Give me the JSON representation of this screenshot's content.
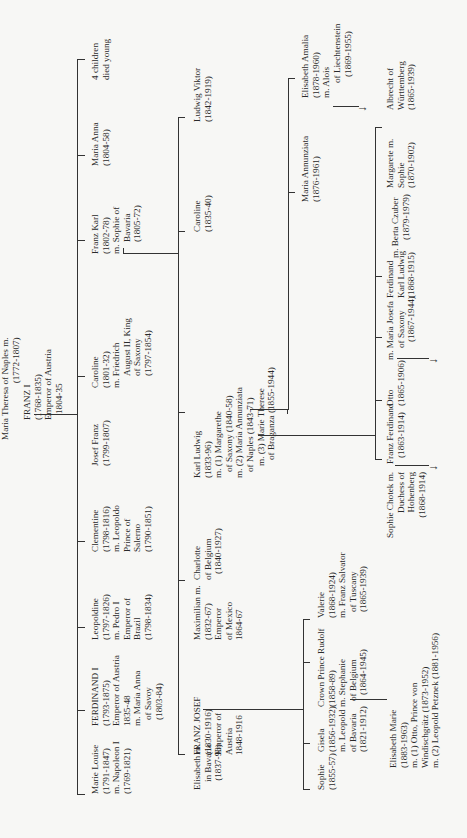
{
  "root": {
    "wife": [
      "Maria Theresa of Naples m.",
      "(1772-1807)"
    ],
    "husband": [
      "FRANZ I",
      "(1768-1835)",
      "Emperor of Austria",
      "1804-35"
    ]
  },
  "gen1": [
    {
      "id": "marie-louise",
      "lines": [
        "Marie Louise",
        "(1791-1847)",
        "m. Napoleon I",
        "(1769-1821)"
      ]
    },
    {
      "id": "ferdinand-i",
      "lines": [
        "FERDINAND I",
        "(1793-1875)",
        "Emperor of Austria",
        "1835-48",
        "m. Maria Anna",
        "of Savoy",
        "(1803-84)"
      ]
    },
    {
      "id": "leopoldine",
      "lines": [
        "Leopoldine",
        "(1797-1826)",
        "m. Pedro I",
        "Emperor of",
        "Brazil",
        "(1798-1834)"
      ]
    },
    {
      "id": "clementine",
      "lines": [
        "Clementine",
        "(1798-1816)",
        "m. Leopoldo",
        "Prince of",
        "Salerno",
        "(1790-1851)"
      ]
    },
    {
      "id": "josef-franz",
      "lines": [
        "Josef Franz",
        "(1799-1807)"
      ]
    },
    {
      "id": "caroline-1801",
      "lines": [
        "Caroline",
        "(1801-32)",
        "m. Friedrich",
        "August II, King",
        "of Saxony",
        "(1797-1854)"
      ]
    },
    {
      "id": "franz-karl",
      "lines": [
        "Franz Karl",
        "(1802-78)",
        "m. Sophie of",
        "Bavaria",
        "(1805-72)"
      ]
    },
    {
      "id": "maria-anna",
      "lines": [
        "Maria Anna",
        "(1804-58)"
      ]
    },
    {
      "id": "four-children",
      "lines": [
        "4 children",
        "died young"
      ]
    }
  ],
  "gen2": [
    {
      "id": "elisabeth-bavaria",
      "lines": [
        "Elisabeth m.",
        "in Bavaria",
        "(1837-98)"
      ]
    },
    {
      "id": "franz-josef",
      "lines": [
        "FRANZ JOSEF",
        "(1830-1916)",
        "Emperor of",
        "Austria",
        "1848-1916"
      ]
    },
    {
      "id": "maximilian",
      "lines": [
        "Maximilian m.",
        "(1832-67)",
        "Emperor",
        "of Mexico",
        "1864-67"
      ]
    },
    {
      "id": "charlotte",
      "lines": [
        "Charlotte",
        "of Belgium",
        "(1840-1927)"
      ]
    },
    {
      "id": "karl-ludwig",
      "lines": [
        "Karl Ludwig",
        "(1833-96)",
        "m. (1) Margarethe",
        "of Saxony (1840-58)",
        "m. (2) Maria Annunziata",
        "of Naples (1843-71)",
        "m. (3) Marie Therese",
        "of Braganza (1855-1944)"
      ]
    },
    {
      "id": "caroline-1835",
      "lines": [
        "Caroline",
        "(1835-40)"
      ]
    },
    {
      "id": "ludwig-viktor",
      "lines": [
        "Ludwig Viktor",
        "(1842-1919)"
      ]
    }
  ],
  "gen3_franz_josef": [
    {
      "id": "sophie",
      "lines": [
        "Sophie",
        "(1855-57)"
      ]
    },
    {
      "id": "gisela",
      "lines": [
        "Gisela",
        "(1856-1932)",
        "m. Leopold",
        "of Bavaria",
        "(1821-1912)"
      ]
    },
    {
      "id": "rudolf",
      "lines": [
        "Crown Prince Rudolf",
        "(1858-89)",
        "m. Stephanie",
        "of Belgium",
        "(1864-1945)"
      ]
    },
    {
      "id": "valerie",
      "lines": [
        "Valerie",
        "(1868-1924)",
        "m. Franz Salvator",
        "of Tuscany",
        "(1865-1939)"
      ]
    }
  ],
  "gen4_rudolf": {
    "id": "elisabeth-marie",
    "lines": [
      "Elisabeth Marie",
      "(1883-1963)",
      "m. (1) Otto, Prince von",
      "Windischgrätz (1873-1952)",
      "m. (2) Leopold Petznek (1881-1956)"
    ]
  },
  "gen3_karl_ludwig": [
    {
      "id": "franz-ferdinand",
      "lines": [
        "Franz Ferdinand",
        "(1863-1914)"
      ]
    },
    {
      "id": "sophie-chotek",
      "lines": [
        "Sophie Chotek m.",
        "Duchess of",
        "Hohenberg",
        "(1868-1914)"
      ]
    },
    {
      "id": "otto",
      "lines": [
        "Otto",
        "(1865-1906)"
      ]
    },
    {
      "id": "maria-josefa",
      "lines": [
        "m. Maria Josefa",
        "of Saxony",
        "(1867-1944)"
      ]
    },
    {
      "id": "ferdinand-karl",
      "lines": [
        "Ferdinand",
        "Karl Ludwig",
        "(1868-1915)"
      ]
    },
    {
      "id": "berta-czuber",
      "lines": [
        "m. Berta Czuber",
        "(1879-1979)"
      ]
    },
    {
      "id": "margarete-sophie",
      "lines": [
        "Margarete m.",
        "Sophie",
        "(1870-1902)"
      ]
    },
    {
      "id": "albrecht",
      "lines": [
        "Albrecht of",
        "Württemberg",
        "(1865-1939)"
      ]
    }
  ],
  "gen3_karl_ludwig_3rd": [
    {
      "id": "maria-annunziata",
      "lines": [
        "Maria Annunziata",
        "(1876-1961)"
      ]
    },
    {
      "id": "elisabeth-amalia",
      "lines": [
        "Elisabeth Amalia",
        "(1878-1960)",
        "m. Alois"
      ]
    },
    {
      "id": "alois",
      "lines": [
        "of Liechtenstein",
        "(1869-1955)"
      ]
    }
  ],
  "arrow_glyph": "↓"
}
